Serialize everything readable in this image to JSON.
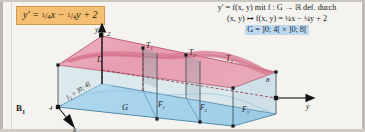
{
  "figure": {
    "caption": "B",
    "caption_sub": "1"
  },
  "formula_box": {
    "lhs": "y′",
    "eq": "=",
    "term1_num": "1",
    "term1_den": "4",
    "term1_var": "x",
    "minus": "−",
    "term2_num": "1",
    "term2_den": "4",
    "term2_var": "y",
    "plus": "+",
    "constant": "2",
    "plain": "y′ = ¼x − ¼y + 2",
    "bg_color": "#f4bf72",
    "border_color": "#d09b49"
  },
  "text_block": {
    "line1": "y′ = f(x, y)   mit   f : G → ℝ   def. durch",
    "line2": "(x, y) ↦ f(x, y) = ¼x − ¼y + 2",
    "line3_highlight": "G = ]0; 4[ × ]0; 8[",
    "highlight_color": "#bcd9ee"
  },
  "diagram": {
    "axes": {
      "x_label": "x",
      "y_label": "y",
      "z_label": "y",
      "z_tick": "2",
      "x_tick": "4",
      "y_tick": "8"
    },
    "domain_label": "G",
    "plane_label": "L",
    "interval_label": "I₁ = ]0; 4[",
    "interval_label_main": "I",
    "interval_label_sub": "1",
    "interval_label_rest": " = ]0; 4[",
    "base_regions": [
      {
        "name": "F",
        "sub": "1"
      },
      {
        "name": "F",
        "sub": "2"
      },
      {
        "name": "F",
        "sub": "3"
      }
    ],
    "top_regions": [
      {
        "name": "T",
        "sub": "1"
      },
      {
        "name": "T",
        "sub": "2"
      },
      {
        "name": "T",
        "sub": "3"
      }
    ],
    "colors": {
      "domain_fill": "#a9d6ef",
      "domain_stroke": "#2f6f9a",
      "plane_fill": "#e8a3b4",
      "plane_stroke": "#b0495f",
      "plane_band": "#d9788f",
      "shadow_fill": "#8f9aa3",
      "axis": "#1c1c1c",
      "dash": "#8a2b3d"
    }
  }
}
